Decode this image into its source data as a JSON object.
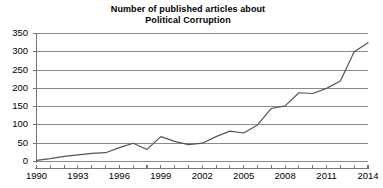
{
  "chart_data": {
    "type": "line",
    "title": "Number of published articles about Political Corruption",
    "title_lines": [
      "Number of published articles about",
      "Political Corruption"
    ],
    "xlabel": "",
    "ylabel": "",
    "xlim": [
      1990,
      2014
    ],
    "ylim": [
      0,
      350
    ],
    "ytick_step": 50,
    "yticks": [
      0,
      50,
      100,
      150,
      200,
      250,
      300,
      350
    ],
    "ytick_labels": [
      "0",
      "50",
      "100",
      "150",
      "200",
      "250",
      "300",
      "350"
    ],
    "xticks": [
      1990,
      1993,
      1996,
      1999,
      2002,
      2005,
      2008,
      2011,
      2014
    ],
    "xtick_labels": [
      "1990",
      "1993",
      "1996",
      "1999",
      "2002",
      "2005",
      "2008",
      "2011",
      "2014"
    ],
    "x": [
      1990,
      1991,
      1992,
      1993,
      1994,
      1995,
      1996,
      1997,
      1998,
      1999,
      2000,
      2001,
      2002,
      2003,
      2004,
      2005,
      2006,
      2007,
      2008,
      2009,
      2010,
      2011,
      2012,
      2013,
      2014
    ],
    "values": [
      3,
      8,
      14,
      18,
      22,
      24,
      38,
      50,
      33,
      68,
      55,
      46,
      50,
      68,
      83,
      78,
      100,
      145,
      152,
      188,
      186,
      200,
      220,
      300,
      325
    ],
    "series": [
      {
        "name": "Published articles",
        "color": "#555555",
        "values": [
          3,
          8,
          14,
          18,
          22,
          24,
          38,
          50,
          33,
          68,
          55,
          46,
          50,
          68,
          83,
          78,
          100,
          145,
          152,
          188,
          186,
          200,
          220,
          300,
          325
        ]
      }
    ],
    "grid": true,
    "grid_color": "#8a8a8a",
    "legend": false,
    "legend_position": "none",
    "axis_color": "#777777",
    "background": "#ffffff"
  }
}
